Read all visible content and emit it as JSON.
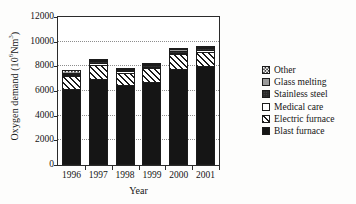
{
  "chart_data": {
    "type": "bar",
    "stacked": true,
    "title": "",
    "xlabel": "Year",
    "ylabel": "Oxygen demand (10⁶Nm³)",
    "ylabel_text": "Oxygen demand (10",
    "ylabel_sup": "6",
    "ylabel_tail": "Nm",
    "ylabel_sup2": "3",
    "ylabel_close": ")",
    "categories": [
      "1996",
      "1997",
      "1998",
      "1999",
      "2000",
      "2001"
    ],
    "ylim": [
      0,
      12000
    ],
    "yticks": [
      0,
      2000,
      4000,
      6000,
      8000,
      10000,
      12000
    ],
    "ytick_labels": [
      "0",
      "2000",
      "4000",
      "6000",
      "8000",
      "10000",
      "12000"
    ],
    "grid": true,
    "grid_style": "dotted",
    "legend_position": "right",
    "series": [
      {
        "name": "Blast furnace",
        "pattern": "solid-black",
        "color": "#151515",
        "values": [
          6200,
          6950,
          6500,
          6700,
          7800,
          8050
        ]
      },
      {
        "name": "Electric furnace",
        "pattern": "diagonal-hatch",
        "color": "#ffffff",
        "values": [
          1000,
          1200,
          1000,
          1150,
          1200,
          1150
        ]
      },
      {
        "name": "Medical care",
        "pattern": "white",
        "color": "#ffffff",
        "values": [
          100,
          120,
          100,
          110,
          120,
          120
        ]
      },
      {
        "name": "Stainless steel",
        "pattern": "dark",
        "color": "#2a2a2a",
        "values": [
          120,
          130,
          110,
          120,
          140,
          130
        ]
      },
      {
        "name": "Glass melting",
        "pattern": "gray",
        "color": "#9a9a9a",
        "values": [
          80,
          100,
          90,
          100,
          110,
          100
        ]
      },
      {
        "name": "Other",
        "pattern": "checkered",
        "color": "#ffffff",
        "values": [
          200,
          100,
          100,
          120,
          130,
          100
        ]
      }
    ],
    "totals": [
      7700,
      8600,
      7900,
      8300,
      9500,
      9650
    ]
  },
  "legend": {
    "entries": [
      {
        "label": "Other",
        "pattern": "checkered"
      },
      {
        "label": "Glass melting",
        "pattern": "gray"
      },
      {
        "label": "Stainless steel",
        "pattern": "dark"
      },
      {
        "label": "Medical care",
        "pattern": "white"
      },
      {
        "label": "Electric furnace",
        "pattern": "diagonal-hatch"
      },
      {
        "label": "Blast furnace",
        "pattern": "solid-black"
      }
    ]
  }
}
